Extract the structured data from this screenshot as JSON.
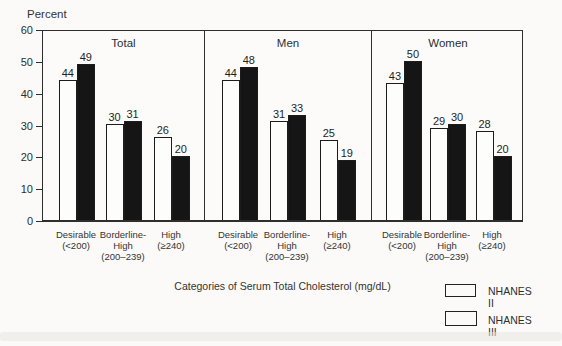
{
  "chart_data": {
    "type": "bar",
    "title": "",
    "ylabel": "Percent",
    "xlabel": "Categories of Serum Total Cholesterol (mg/dL)",
    "ylim": [
      0,
      60
    ],
    "yticks": [
      0,
      10,
      20,
      30,
      40,
      50,
      60
    ],
    "grid": false,
    "legend_position": "bottom-right",
    "categories": [
      [
        "Desirable",
        "(<200)"
      ],
      [
        "Borderline-",
        "High",
        "(200–239)"
      ],
      [
        "High",
        "(≥240)"
      ]
    ],
    "legend": [
      {
        "name": "NHANES II",
        "color": "#fdfdfc"
      },
      {
        "name": "NHANES III",
        "color": "#151515"
      }
    ],
    "panels": [
      {
        "title": "Total",
        "series": [
          {
            "name": "NHANES II",
            "values": [
              44,
              30,
              26
            ]
          },
          {
            "name": "NHANES III",
            "values": [
              49,
              31,
              20
            ]
          }
        ]
      },
      {
        "title": "Men",
        "series": [
          {
            "name": "NHANES II",
            "values": [
              44,
              31,
              25
            ]
          },
          {
            "name": "NHANES III",
            "values": [
              48,
              33,
              19
            ]
          }
        ]
      },
      {
        "title": "Women",
        "series": [
          {
            "name": "NHANES II",
            "values": [
              43,
              29,
              28
            ]
          },
          {
            "name": "NHANES III",
            "values": [
              50,
              30,
              20
            ]
          }
        ]
      }
    ],
    "colors": {
      "frame": "#2e2e2e",
      "bar_outline": "#1c1c1c",
      "background": "#fbfaf8"
    }
  }
}
